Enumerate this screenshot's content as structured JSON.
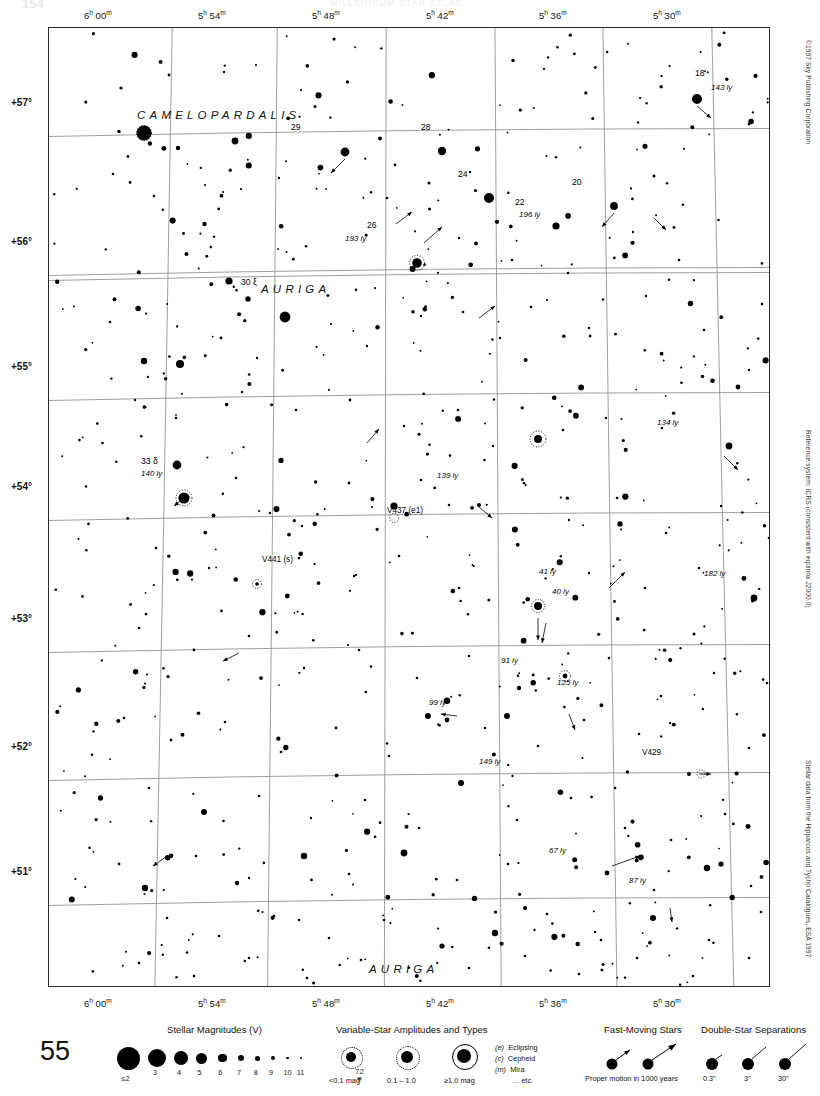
{
  "page": {
    "folio": "154",
    "page_number": "55",
    "header_title": "MILLENNIUM STAR ATLAS",
    "copyright": "©1997 Sky Publishing Corporation",
    "reference_note": "Reference system: ICRS (consistent with equinox J2000.0)",
    "source_note": "Stellar data from the Hipparcos and Tycho Catalogues, ESA 1997",
    "adjacent_chart": "72"
  },
  "axes": {
    "ra_ticks": [
      {
        "label": "6h 00m",
        "h": "6",
        "m": "00",
        "x": 112
      },
      {
        "label": "5h 54m",
        "h": "5",
        "m": "54",
        "x": 222
      },
      {
        "label": "5h 48m",
        "h": "5",
        "m": "48",
        "x": 336
      },
      {
        "label": "5h 42m",
        "h": "5",
        "m": "42",
        "x": 450
      },
      {
        "label": "5h 36m",
        "h": "5",
        "m": "36",
        "x": 563
      },
      {
        "label": "5h 30m",
        "h": "5",
        "m": "30",
        "x": 677
      }
    ],
    "dec_ticks": [
      {
        "label": "+57°",
        "y": 104
      },
      {
        "label": "+56°",
        "y": 243
      },
      {
        "label": "+55°",
        "y": 368
      },
      {
        "label": "+54°",
        "y": 488
      },
      {
        "label": "+53°",
        "y": 620
      },
      {
        "label": "+52°",
        "y": 748
      },
      {
        "label": "+51°",
        "y": 873
      }
    ]
  },
  "constellations": [
    {
      "name": "CAMELOPARDALIS",
      "x": 88,
      "y": 88
    },
    {
      "name": "AURIGA",
      "x": 261,
      "y": 261
    },
    {
      "name": "AURIGA",
      "x": 365,
      "y": 941
    }
  ],
  "labels": [
    {
      "kind": "star",
      "name": "18",
      "distance": "143 ly",
      "x": 648,
      "y": 71
    },
    {
      "kind": "star",
      "name": "29",
      "distance": "",
      "x": 296,
      "y": 124
    },
    {
      "kind": "star",
      "name": "28",
      "distance": "",
      "x": 393,
      "y": 123
    },
    {
      "kind": "star",
      "name": "24",
      "distance": "",
      "x": 440,
      "y": 170
    },
    {
      "kind": "star",
      "name": "20",
      "distance": "",
      "x": 565,
      "y": 178
    },
    {
      "kind": "star",
      "name": "22",
      "distance": "196 ly",
      "x": 512,
      "y": 198
    },
    {
      "kind": "star",
      "name": "26",
      "distance": "193 ly",
      "x": 368,
      "y": 220
    },
    {
      "kind": "star",
      "name": "30 ξ",
      "distance": "",
      "x": 242,
      "y": 282
    },
    {
      "kind": "star",
      "name": "33 δ",
      "distance": "140 ly",
      "x": 142,
      "y": 455
    },
    {
      "kind": "var",
      "name": "V437 (e1)",
      "distance": "",
      "x": 325,
      "y": 504
    },
    {
      "kind": "var",
      "name": "V441 (s)",
      "distance": "",
      "x": 200,
      "y": 553
    },
    {
      "kind": "var",
      "name": "V429",
      "distance": "",
      "x": 638,
      "y": 746
    },
    {
      "kind": "dist",
      "name": "",
      "distance": "134 ly",
      "x": 653,
      "y": 421
    },
    {
      "kind": "dist",
      "name": "",
      "distance": "139 ly",
      "x": 430,
      "y": 473
    },
    {
      "kind": "dist",
      "name": "",
      "distance": "182 ly",
      "x": 692,
      "y": 572
    },
    {
      "kind": "dist",
      "name": "",
      "distance": "41 ly",
      "x": 489,
      "y": 568
    },
    {
      "kind": "dist",
      "name": "",
      "distance": "40 ly",
      "x": 503,
      "y": 585
    },
    {
      "kind": "dist",
      "name": "",
      "distance": "91 ly",
      "x": 497,
      "y": 658
    },
    {
      "kind": "dist",
      "name": "",
      "distance": "125 ly",
      "x": 520,
      "y": 679
    },
    {
      "kind": "dist",
      "name": "",
      "distance": "99 ly",
      "x": 418,
      "y": 692
    },
    {
      "kind": "dist",
      "name": "",
      "distance": "149 ly",
      "x": 418,
      "y": 755
    },
    {
      "kind": "dist",
      "name": "",
      "distance": "67 ly",
      "x": 543,
      "y": 845
    },
    {
      "kind": "dist",
      "name": "",
      "distance": "87 ly",
      "x": 620,
      "y": 874
    }
  ],
  "legend": {
    "magnitudes": {
      "title": "Stellar Magnitudes (V)",
      "labels": [
        "≤2",
        "3",
        "4",
        "5",
        "6",
        "7",
        "8",
        "9",
        "10",
        "11"
      ],
      "radii": [
        11.5,
        9,
        7,
        5.5,
        4.3,
        3.3,
        2.5,
        1.9,
        1.4,
        1.0
      ]
    },
    "variables": {
      "title": "Variable-Star Amplitudes and Types",
      "amplitudes": [
        "<0.1 mag",
        "0.1 – 1.0",
        "≥1.0 mag"
      ],
      "types": [
        {
          "code": "(e)",
          "name": "Eclipsing"
        },
        {
          "code": "(c)",
          "name": "Cepheid"
        },
        {
          "code": "(m)",
          "name": "Mira"
        },
        {
          "code": "",
          "name": "... etc."
        }
      ]
    },
    "fast_moving": {
      "title": "Fast-Moving Stars",
      "caption": "Proper motion in 1000 years"
    },
    "doubles": {
      "title": "Double-Star Separations",
      "labels": [
        "0.3\"",
        "3\"",
        "30\""
      ]
    }
  },
  "chart_data": {
    "type": "scatter",
    "xlabel": "Right Ascension",
    "ylabel": "Declination",
    "xlim": [
      "6h 03m",
      "5h 27m"
    ],
    "ylim": [
      "+50.6°",
      "+57.4°"
    ],
    "grid": true,
    "legend_position": "below-plot",
    "stars": [
      [
        95,
        105,
        7.5
      ],
      [
        72,
        60,
        1.6
      ],
      [
        120,
        47,
        1.4
      ],
      [
        175,
        44,
        1.2
      ],
      [
        207,
        37,
        1.1
      ],
      [
        252,
        62,
        1.1
      ],
      [
        129,
        120,
        2.2
      ],
      [
        186,
        113,
        3.4
      ],
      [
        64,
        146,
        1.3
      ],
      [
        105,
        168,
        1.2
      ],
      [
        156,
        157,
        1.1
      ],
      [
        230,
        150,
        1.2
      ],
      [
        296,
        124,
        4.4
      ],
      [
        346,
        137,
        1.4
      ],
      [
        393,
        123,
        4.2
      ],
      [
        338,
        170,
        1.3
      ],
      [
        380,
        155,
        1.5
      ],
      [
        421,
        144,
        1.2
      ],
      [
        440,
        170,
        5.0
      ],
      [
        507,
        198,
        3.6
      ],
      [
        565,
        178,
        3.9
      ],
      [
        605,
        148,
        1.5
      ],
      [
        648,
        71,
        5.0
      ],
      [
        700,
        96,
        1.4
      ],
      [
        745,
        44,
        4.0
      ],
      [
        368,
        235,
        4.8
      ],
      [
        410,
        210,
        1.2
      ],
      [
        463,
        232,
        1.3
      ],
      [
        519,
        245,
        1.3
      ],
      [
        584,
        204,
        1.2
      ],
      [
        630,
        232,
        1.3
      ],
      [
        180,
        253,
        3.6
      ],
      [
        236,
        289,
        5.4
      ],
      [
        172,
        310,
        1.4
      ],
      [
        208,
        330,
        1.2
      ],
      [
        95,
        333,
        3.2
      ],
      [
        131,
        336,
        4.0
      ],
      [
        61,
        294,
        1.3
      ],
      [
        282,
        296,
        1.1
      ],
      [
        318,
        318,
        1.2
      ],
      [
        372,
        288,
        1.2
      ],
      [
        414,
        284,
        1.3
      ],
      [
        451,
        310,
        1.2
      ],
      [
        498,
        272,
        1.1
      ],
      [
        540,
        300,
        1.2
      ],
      [
        597,
        268,
        1.2
      ],
      [
        655,
        302,
        1.3
      ],
      [
        713,
        276,
        1.3
      ],
      [
        745,
        322,
        1.4
      ],
      [
        700,
        342,
        1.2
      ],
      [
        86,
        372,
        1.2
      ],
      [
        127,
        390,
        1.3
      ],
      [
        193,
        364,
        1.2
      ],
      [
        247,
        382,
        1.3
      ],
      [
        301,
        372,
        1.4
      ],
      [
        355,
        398,
        1.2
      ],
      [
        409,
        382,
        1.3
      ],
      [
        444,
        418,
        1.2
      ],
      [
        489,
        411,
        4.0
      ],
      [
        514,
        402,
        1.3
      ],
      [
        557,
        390,
        1.2
      ],
      [
        613,
        400,
        1.3
      ],
      [
        680,
        418,
        3.4
      ],
      [
        736,
        395,
        1.3
      ],
      [
        128,
        437,
        4.4
      ],
      [
        135,
        470,
        5.6
      ],
      [
        187,
        450,
        1.3
      ],
      [
        221,
        485,
        1.2
      ],
      [
        300,
        455,
        1.4
      ],
      [
        253,
        498,
        1.2
      ],
      [
        345,
        478,
        3.6
      ],
      [
        372,
        452,
        1.3
      ],
      [
        430,
        477,
        2.0
      ],
      [
        475,
        455,
        1.3
      ],
      [
        520,
        492,
        1.2
      ],
      [
        568,
        470,
        1.3
      ],
      [
        617,
        505,
        1.3
      ],
      [
        672,
        478,
        1.2
      ],
      [
        720,
        510,
        1.3
      ],
      [
        758,
        460,
        1.4
      ],
      [
        107,
        520,
        1.3
      ],
      [
        160,
        540,
        1.2
      ],
      [
        208,
        556,
        1.8
      ],
      [
        250,
        530,
        1.3
      ],
      [
        305,
        548,
        1.2
      ],
      [
        350,
        528,
        1.3
      ],
      [
        410,
        560,
        1.3
      ],
      [
        489,
        578,
        4.0
      ],
      [
        540,
        545,
        1.2
      ],
      [
        596,
        560,
        1.3
      ],
      [
        650,
        540,
        1.2
      ],
      [
        705,
        570,
        3.4
      ],
      [
        750,
        556,
        1.3
      ],
      [
        90,
        600,
        1.3
      ],
      [
        145,
        622,
        1.4
      ],
      [
        200,
        608,
        1.3
      ],
      [
        255,
        640,
        1.2
      ],
      [
        310,
        622,
        1.3
      ],
      [
        368,
        650,
        1.3
      ],
      [
        420,
        628,
        1.2
      ],
      [
        470,
        660,
        2.2
      ],
      [
        516,
        648,
        2.4
      ],
      [
        560,
        630,
        1.3
      ],
      [
        612,
        668,
        1.3
      ],
      [
        665,
        645,
        1.2
      ],
      [
        718,
        655,
        1.3
      ],
      [
        752,
        680,
        1.3
      ],
      [
        75,
        690,
        1.3
      ],
      [
        122,
        712,
        1.4
      ],
      [
        176,
        694,
        1.3
      ],
      [
        232,
        724,
        1.3
      ],
      [
        287,
        700,
        1.4
      ],
      [
        340,
        728,
        1.3
      ],
      [
        398,
        692,
        2.4
      ],
      [
        436,
        700,
        1.2
      ],
      [
        458,
        688,
        3.0
      ],
      [
        489,
        718,
        1.3
      ],
      [
        535,
        692,
        1.3
      ],
      [
        590,
        706,
        1.3
      ],
      [
        640,
        746,
        2.0
      ],
      [
        700,
        720,
        1.3
      ],
      [
        748,
        742,
        1.3
      ],
      [
        100,
        760,
        1.3
      ],
      [
        155,
        784,
        3.0
      ],
      [
        210,
        768,
        1.3
      ],
      [
        262,
        790,
        1.2
      ],
      [
        316,
        772,
        1.3
      ],
      [
        370,
        800,
        1.3
      ],
      [
        412,
        755,
        3.0
      ],
      [
        468,
        792,
        1.3
      ],
      [
        522,
        770,
        1.3
      ],
      [
        576,
        800,
        1.3
      ],
      [
        622,
        812,
        1.3
      ],
      [
        676,
        786,
        1.3
      ],
      [
        730,
        808,
        1.3
      ],
      [
        70,
        836,
        1.4
      ],
      [
        96,
        860,
        3.2
      ],
      [
        147,
        828,
        1.3
      ],
      [
        200,
        850,
        1.2
      ],
      [
        255,
        828,
        3.2
      ],
      [
        300,
        846,
        1.3
      ],
      [
        355,
        825,
        3.4
      ],
      [
        408,
        852,
        1.3
      ],
      [
        459,
        836,
        1.3
      ],
      [
        558,
        845,
        2.4
      ],
      [
        605,
        862,
        1.3
      ],
      [
        658,
        840,
        3.2
      ],
      [
        672,
        836,
        2.6
      ],
      [
        702,
        858,
        1.3
      ],
      [
        748,
        826,
        1.3
      ],
      [
        118,
        890,
        1.3
      ],
      [
        170,
        908,
        1.3
      ],
      [
        225,
        888,
        1.3
      ],
      [
        280,
        910,
        1.3
      ],
      [
        335,
        892,
        1.3
      ],
      [
        393,
        918,
        2.6
      ],
      [
        446,
        905,
        3.2
      ],
      [
        498,
        886,
        1.3
      ],
      [
        552,
        912,
        1.3
      ],
      [
        604,
        890,
        3.0
      ],
      [
        660,
        912,
        1.3
      ],
      [
        712,
        884,
        1.3
      ],
      [
        760,
        906,
        1.3
      ],
      [
        90,
        935,
        1.3
      ],
      [
        145,
        948,
        1.3
      ],
      [
        200,
        930,
        1.3
      ],
      [
        258,
        950,
        1.3
      ],
      [
        312,
        932,
        1.3
      ],
      [
        420,
        940,
        1.3
      ],
      [
        476,
        928,
        1.3
      ],
      [
        530,
        946,
        1.3
      ],
      [
        588,
        930,
        1.3
      ],
      [
        644,
        948,
        1.3
      ],
      [
        700,
        930,
        1.3
      ]
    ]
  }
}
